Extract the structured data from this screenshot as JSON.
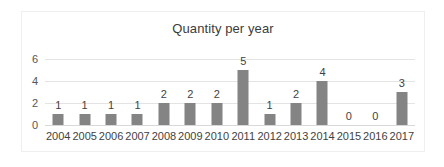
{
  "chart_data": {
    "type": "bar",
    "title": "Quantity per year",
    "xlabel": "",
    "ylabel": "",
    "categories": [
      "2004",
      "2005",
      "2006",
      "2007",
      "2008",
      "2009",
      "2010",
      "2011",
      "2012",
      "2013",
      "2014",
      "2015",
      "2016",
      "2017"
    ],
    "values": [
      1,
      1,
      1,
      1,
      2,
      2,
      2,
      5,
      1,
      2,
      4,
      0,
      0,
      3
    ],
    "data_labels": [
      "1",
      "1",
      "1",
      "1",
      "2",
      "2",
      "2",
      "5",
      "1",
      "2",
      "4",
      "0",
      "0",
      "3"
    ],
    "ylim": [
      0,
      6
    ],
    "yticks": [
      0,
      2,
      4,
      6
    ],
    "ytick_labels": [
      "0",
      "2",
      "4",
      "6"
    ],
    "grid": true,
    "legend": false,
    "legend_position": "none",
    "colors": {
      "bar": "#848484",
      "gridline": "#e4e4e4",
      "baseline": "#d8d8d8",
      "frame_border": "#efefef",
      "title_text": "#3b3b3b",
      "tick_text": "#555555",
      "label_text": "#3f3f3f",
      "background": "#ffffff"
    }
  }
}
